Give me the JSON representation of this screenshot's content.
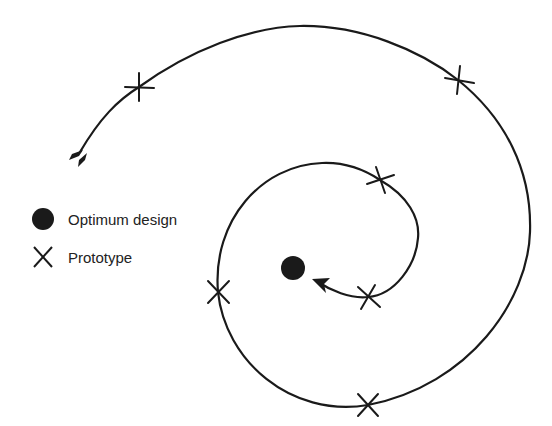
{
  "diagram": {
    "title": "",
    "colors": {
      "line": "#1a1a1a",
      "marker": "#1a1a1a",
      "background": "#ffffff"
    },
    "path_description": "Spiral design path converging clockwise on the optimum design",
    "start_marker": "arrow-fletching",
    "end_marker": "arrowhead",
    "prototypes": [
      {
        "x": 139,
        "y": 87
      },
      {
        "x": 458,
        "y": 80
      },
      {
        "x": 368,
        "y": 405
      },
      {
        "x": 218,
        "y": 292
      },
      {
        "x": 380,
        "y": 180
      },
      {
        "x": 368,
        "y": 297
      }
    ],
    "optimum": {
      "x": 293,
      "y": 268,
      "r": 12
    }
  },
  "legend": {
    "items": [
      {
        "icon": "filled-circle",
        "label": "Optimum design"
      },
      {
        "icon": "x-cross",
        "label": "Prototype"
      }
    ]
  }
}
